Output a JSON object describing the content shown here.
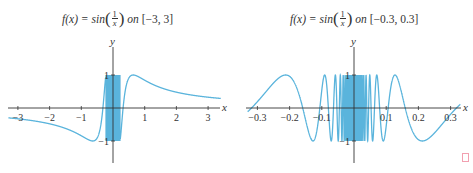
{
  "chart_data": [
    {
      "type": "line",
      "title": "f(x) = sin(1/x) on [-3, 3]",
      "title_parts": {
        "lhs": "f(x) = sin",
        "num": "1",
        "den": "x",
        "on": "on",
        "interval": "[−3, 3]"
      },
      "function": "sin(1/x)",
      "xlabel": "x",
      "ylabel": "y",
      "xlim": [
        -3.3,
        3.4
      ],
      "ylim": [
        -1.3,
        1.3
      ],
      "xticks": [
        -3,
        -2,
        -1,
        1,
        2,
        3
      ],
      "xtick_labels": [
        "−3",
        "−2",
        "−1",
        "1",
        "2",
        "3"
      ],
      "yticks": [
        1,
        -1
      ],
      "ytick_labels": [
        "1",
        "−1"
      ],
      "grid": false,
      "color": "#5ab4dc",
      "band_color": "#3a9acb",
      "dense_band_x": [
        -0.23,
        0.23
      ],
      "pixel_map": {
        "x0": 113,
        "xscale": 31.7,
        "y0": 108,
        "yscale": 33,
        "axis_x": [
          8,
          220
        ],
        "axis_y": [
          47,
          163
        ]
      }
    },
    {
      "type": "line",
      "title": "f(x) = sin(1/x) on [-0.3, 0.3]",
      "title_parts": {
        "lhs": "f(x) = sin",
        "num": "1",
        "den": "x",
        "on": "on",
        "interval": "[−0.3, 0.3]"
      },
      "function": "sin(1/x)",
      "xlabel": "x",
      "ylabel": "y",
      "xlim": [
        -0.33,
        0.33
      ],
      "ylim": [
        -1.3,
        1.3
      ],
      "xticks": [
        -0.3,
        -0.2,
        -0.1,
        0.1,
        0.2,
        0.3
      ],
      "xtick_labels": [
        "−0.3",
        "−0.2",
        "−0.1",
        "0.1",
        "0.2",
        "0.3"
      ],
      "yticks": [
        1,
        -1
      ],
      "ytick_labels": [
        "1",
        "−1"
      ],
      "grid": false,
      "color": "#5ab4dc",
      "band_color": "#3a9acb",
      "dense_band_x": [
        -0.025,
        0.025
      ],
      "pixel_map": {
        "x0": 354,
        "xscale": 322,
        "y0": 108,
        "yscale": 33,
        "axis_x": [
          246,
          461
        ],
        "axis_y": [
          47,
          163
        ]
      }
    }
  ]
}
